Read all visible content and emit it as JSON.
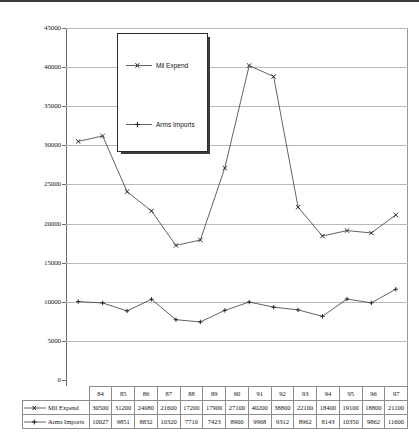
{
  "chart_data": {
    "type": "line",
    "title": "",
    "subtitle": "",
    "xlabel": "",
    "ylabel": "",
    "categories": [
      "84",
      "85",
      "86",
      "87",
      "88",
      "89",
      "90",
      "91",
      "92",
      "93",
      "94",
      "95",
      "96",
      "97"
    ],
    "ylim": [
      0,
      45000
    ],
    "ytick_values": [
      0,
      5000,
      10000,
      15000,
      20000,
      25000,
      30000,
      35000,
      40000,
      45000
    ],
    "ytick_labels": [
      "0",
      "5000",
      "10000",
      "15000",
      "20000",
      "25000",
      "30000",
      "35000",
      "40000",
      "45000"
    ],
    "grid": "horizontal",
    "legend_position": "inside-top-left",
    "series": [
      {
        "name": "Mil Expend",
        "marker": "x-marker",
        "color": "#3a3a3a",
        "values": [
          30500,
          31200,
          24080,
          21600,
          17200,
          17900,
          27100,
          40200,
          38800,
          22100,
          18400,
          19100,
          18800,
          21100
        ]
      },
      {
        "name": "Arms Imports",
        "marker": "plus-marker",
        "color": "#3a3a3a",
        "values": [
          10027,
          9851,
          8832,
          10320,
          7710,
          7423,
          8900,
          9968,
          9312,
          8962,
          8143,
          10350,
          9862,
          11600
        ]
      }
    ]
  },
  "legend": {
    "entries": [
      {
        "label": "Mil Expend"
      },
      {
        "label": "Arms Imports"
      }
    ]
  },
  "table": {
    "corner_label": "",
    "header": [
      "84",
      "85",
      "86",
      "87",
      "88",
      "89",
      "90",
      "91",
      "92",
      "93",
      "94",
      "95",
      "96",
      "97"
    ],
    "rows": [
      {
        "label": "Mil Expend",
        "values": [
          "30500",
          "31200",
          "24080",
          "21600",
          "17200",
          "17900",
          "27100",
          "40200",
          "38800",
          "22100",
          "18400",
          "19100",
          "18800",
          "21100"
        ]
      },
      {
        "label": "Arms Imports",
        "values": [
          "10027",
          "9851",
          "8832",
          "10320",
          "7710",
          "7423",
          "8900",
          "9968",
          "9312",
          "8962",
          "8143",
          "10350",
          "9862",
          "11600"
        ]
      }
    ]
  },
  "colors": {
    "gridline": "#b9b9b9",
    "axis": "#6e6e6e",
    "series_line": "#3a3a3a",
    "table_border": "#8d8d8d",
    "legend_border": "#2b2b2b"
  }
}
